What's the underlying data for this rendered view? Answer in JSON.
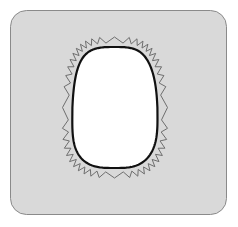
{
  "diagram": {
    "colors": {
      "page_background": "#ffffff",
      "panel_fill": "#d9d9d9",
      "panel_stroke": "#8a8a8a",
      "blob_fill": "#ffffff",
      "blob_stroke": "#111111",
      "zigzag_stroke": "#6e6e6e"
    },
    "panel": {
      "x": 10,
      "y": 10,
      "width": 216,
      "height": 204,
      "radius": 16
    },
    "blob": {
      "x": 72,
      "y": 47,
      "width": 85,
      "height": 121
    },
    "zigzag": {
      "offset": 6,
      "teeth": 44,
      "amplitude": 4
    }
  }
}
